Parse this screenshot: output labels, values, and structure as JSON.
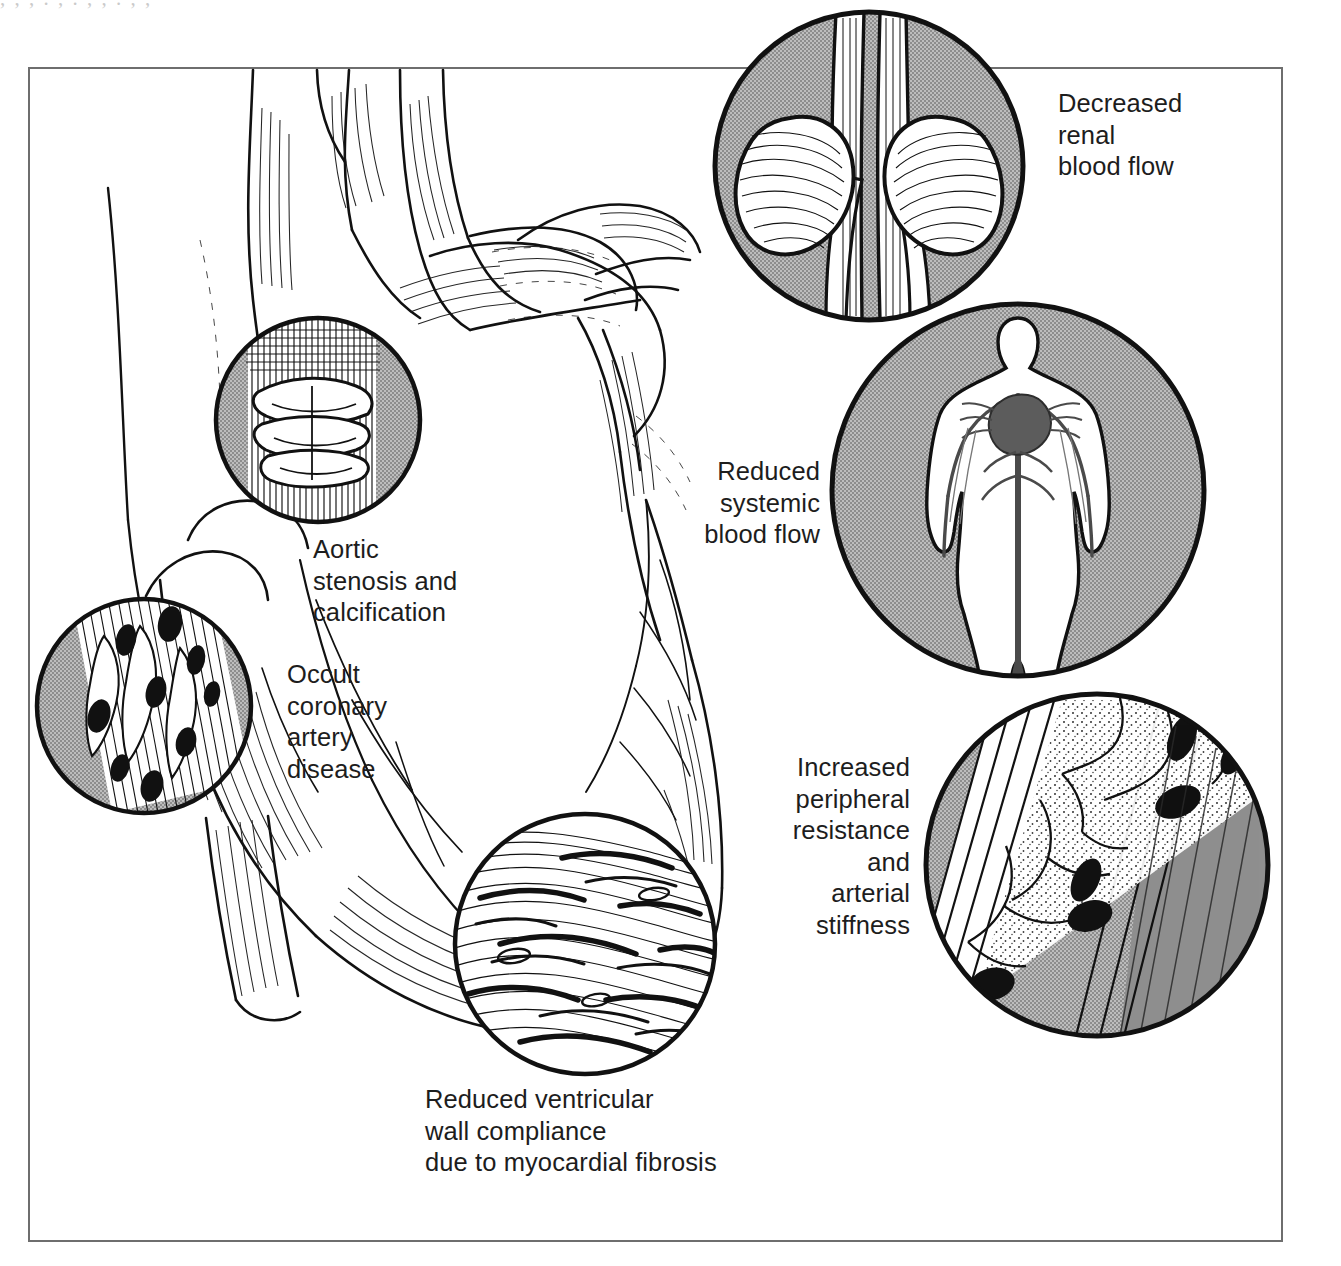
{
  "figure": {
    "kind": "medical-illustration",
    "title_visible": false,
    "page_ghost_text": ",  ,  ,  .  ,  .  ,  ,  .  ,  ,",
    "frame": {
      "style": "thin-rectangle-border",
      "color": "#6e6e6e"
    },
    "palette": {
      "ink": "#111111",
      "paper": "#ffffff",
      "inset_gray": "#a6a6a6",
      "inset_gray_dark": "#8f8f8f",
      "frame": "#6e6e6e"
    }
  },
  "captions": {
    "aortic_stenosis": "Aortic\nstenosis and\ncalcification",
    "occult_cad": "Occult\ncoronary\nartery\ndisease",
    "ventricular_compliance": "Reduced ventricular\nwall compliance\ndue to myocardial fibrosis",
    "renal_blood_flow": "Decreased\nrenal\nblood flow",
    "systemic_blood_flow": "Reduced\nsystemic\nblood flow",
    "peripheral_resistance": "Increased\nperipheral\nresistance\nand\narterial\nstiffness"
  },
  "insets": [
    {
      "id": "aortic-valve",
      "label": "Aortic stenosis and calcification",
      "shading": "gray-crescent",
      "subject": "calcified aortic valve cusps"
    },
    {
      "id": "coronary-plaque",
      "label": "Occult coronary artery disease",
      "shading": "gray-crescent",
      "subject": "atherosclerotic coronary artery"
    },
    {
      "id": "myocardial-fibrosis",
      "label": "Reduced ventricular wall compliance due to myocardial fibrosis",
      "shading": "none",
      "subject": "fibrotic myocardium"
    },
    {
      "id": "kidneys",
      "label": "Decreased renal blood flow",
      "shading": "gray-disc",
      "subject": "kidneys with renal arteries, aorta and vena cava"
    },
    {
      "id": "body-circulation",
      "label": "Reduced systemic blood flow",
      "shading": "gray-disc",
      "subject": "whole-body figure with vascular tree and heart"
    },
    {
      "id": "arterial-wall",
      "label": "Increased peripheral resistance and arterial stiffness",
      "shading": "gray-disc",
      "subject": "stiffened arterial wall in longitudinal section"
    }
  ],
  "main_subject": {
    "name": "heart-and-great-vessels",
    "parts": [
      "ascending aorta",
      "aortic arch",
      "brachiocephalic trunk",
      "left common carotid artery",
      "left subclavian artery",
      "pulmonary artery",
      "left atrium",
      "left ventricle",
      "right ventricle",
      "coronary arteries"
    ]
  }
}
